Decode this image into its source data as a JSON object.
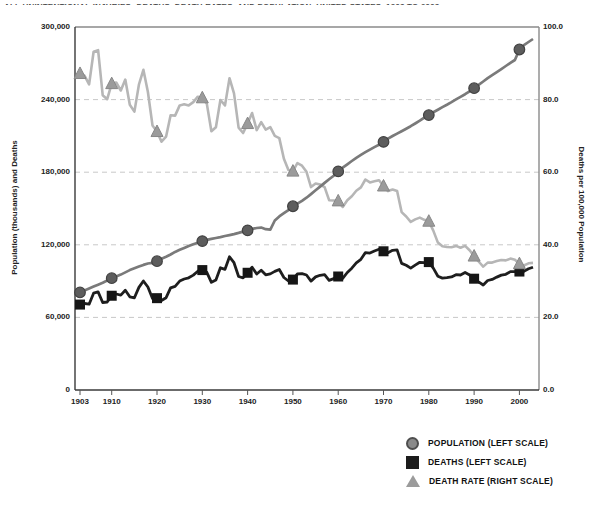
{
  "title": {
    "clipped_text": "ALL UNINTENTIONAL INJURIES: DEATHS, DEATH RATES, AND POPULATION, UNITED STATES, 1903 TO 2003"
  },
  "axes": {
    "left_label": "Population (thousands) and Deaths",
    "right_label": "Deaths per 100,000 Population",
    "left_ticks": [
      "300,000",
      "240,000",
      "180,000",
      "120,000",
      "60,000",
      "0"
    ],
    "right_ticks": [
      "100.0",
      "80.0",
      "60.0",
      "40.0",
      "20.0",
      "0.0"
    ],
    "x_ticks": [
      "1903",
      "1910",
      "1920",
      "1930",
      "1940",
      "1950",
      "1960",
      "1970",
      "1980",
      "1990",
      "2000"
    ]
  },
  "legend": {
    "items": [
      {
        "marker": "circle",
        "label": "POPULATION (LEFT SCALE)",
        "color": "#8a8a8a"
      },
      {
        "marker": "square",
        "label": "DEATHS (LEFT SCALE)",
        "color": "#1c1c1c"
      },
      {
        "marker": "triangle",
        "label": "DEATH RATE (RIGHT SCALE)",
        "color": "#9b9b9b"
      }
    ]
  },
  "colors": {
    "population_line": "#7a7a7a",
    "population_marker_fill": "#5d5d5d",
    "population_marker_stroke": "#424242",
    "deaths_line": "#1e1e1e",
    "deaths_marker_fill": "#161616",
    "rate_line": "#b6b6b6",
    "rate_marker_fill": "#9b9b9b",
    "rate_marker_stroke": "#878787",
    "gridline": "#c8c8c8",
    "frame_light": "#8a8a8a",
    "frame_dark": "#3a3a3a",
    "tick": "#555555"
  },
  "chart_data": {
    "type": "line",
    "title": "All unintentional injuries: deaths, death rates, and population, United States, 1903 to 2003",
    "xlabel": "",
    "ylabel_left": "Population (thousands) and Deaths",
    "ylabel_right": "Deaths per 100,000 Population",
    "left_ylim": [
      0,
      300000
    ],
    "right_ylim": [
      0,
      100
    ],
    "grid": "horizontal-dashed",
    "grid_values_right": [
      80,
      60,
      40,
      20
    ],
    "legend_position": "below-right",
    "marker_years": [
      1903,
      1910,
      1920,
      1930,
      1940,
      1950,
      1960,
      1970,
      1980,
      1990,
      2000
    ],
    "x": [
      1903,
      1904,
      1905,
      1906,
      1907,
      1908,
      1909,
      1910,
      1911,
      1912,
      1913,
      1914,
      1915,
      1916,
      1917,
      1918,
      1919,
      1920,
      1921,
      1922,
      1923,
      1924,
      1925,
      1926,
      1927,
      1928,
      1929,
      1930,
      1931,
      1932,
      1933,
      1934,
      1935,
      1936,
      1937,
      1938,
      1939,
      1940,
      1941,
      1942,
      1943,
      1944,
      1945,
      1946,
      1947,
      1948,
      1949,
      1950,
      1951,
      1952,
      1953,
      1954,
      1955,
      1956,
      1957,
      1958,
      1959,
      1960,
      1961,
      1962,
      1963,
      1964,
      1965,
      1966,
      1967,
      1968,
      1969,
      1970,
      1971,
      1972,
      1973,
      1974,
      1975,
      1976,
      1977,
      1978,
      1979,
      1980,
      1981,
      1982,
      1983,
      1984,
      1985,
      1986,
      1987,
      1988,
      1989,
      1990,
      1991,
      1992,
      1993,
      1994,
      1995,
      1996,
      1997,
      1998,
      1999,
      2000,
      2001,
      2002,
      2003
    ],
    "series": [
      {
        "name": "Population (thousands)",
        "axis": "left",
        "marker": "circle",
        "values": [
          80632,
          82165,
          83820,
          85437,
          87000,
          88709,
          90492,
          92407,
          93868,
          95331,
          97227,
          99118,
          100549,
          101966,
          103414,
          104550,
          105063,
          106461,
          108538,
          110049,
          111947,
          114109,
          115829,
          117397,
          119035,
          120509,
          121767,
          123077,
          124040,
          124840,
          125579,
          126374,
          127250,
          128053,
          128825,
          129825,
          130880,
          131954,
          133121,
          133920,
          134245,
          132885,
          132481,
          140054,
          143446,
          146093,
          148665,
          151868,
          153982,
          156393,
          158956,
          161884,
          165069,
          168088,
          171187,
          174149,
          177135,
          180671,
          183691,
          186538,
          189242,
          191889,
          194303,
          196560,
          198712,
          200706,
          202677,
          205052,
          207661,
          209896,
          211909,
          213854,
          215973,
          218035,
          220239,
          222585,
          225055,
          227225,
          229466,
          231664,
          233792,
          235825,
          237924,
          240133,
          242289,
          244499,
          246819,
          249438,
          252127,
          254995,
          257746,
          260289,
          262765,
          265190,
          267744,
          270299,
          272691,
          281422,
          284969,
          287625,
          290108
        ]
      },
      {
        "name": "Deaths",
        "axis": "left",
        "marker": "square",
        "values": [
          70600,
          71500,
          70900,
          80000,
          81070,
          72300,
          72700,
          77900,
          79300,
          78400,
          82500,
          77000,
          76200,
          84800,
          90100,
          85100,
          75500,
          75900,
          74000,
          76300,
          84400,
          85600,
          90000,
          91700,
          92700,
          95000,
          98200,
          99100,
          97300,
          89000,
          90932,
          100977,
          99773,
          110052,
          105205,
          93805,
          92623,
          96885,
          101513,
          95889,
          99038,
          95237,
          95918,
          98033,
          99579,
          93000,
          90106,
          91249,
          95871,
          96172,
          95032,
          90032,
          93443,
          94780,
          95307,
          90604,
          92080,
          93806,
          92249,
          97139,
          100669,
          105000,
          108004,
          113563,
          113169,
          114864,
          116385,
          114638,
          113439,
          115448,
          115821,
          104622,
          103030,
          100761,
          103202,
          105561,
          105312,
          105718,
          100704,
          94082,
          92488,
          92911,
          93457,
          95277,
          95020,
          97100,
          95028,
          91983,
          89347,
          86777,
          90523,
          91437,
          93320,
          94948,
          95644,
          97835,
          97860,
          97900,
          98000,
          100200,
          101500
        ]
      },
      {
        "name": "Death rate per 100,000 population",
        "axis": "right",
        "marker": "triangle",
        "values": [
          87.2,
          86.6,
          84.2,
          93.2,
          93.6,
          81.2,
          80.1,
          84.4,
          84.7,
          82.5,
          85.5,
          78.6,
          76.7,
          84.1,
          88.2,
          82.1,
          72.9,
          71.2,
          68.4,
          69.8,
          75.7,
          75.6,
          78.4,
          78.7,
          78.4,
          79.3,
          80.8,
          80.5,
          78.9,
          71.3,
          72.4,
          79.9,
          78.4,
          85.9,
          81.7,
          72.3,
          70.8,
          73.4,
          76.3,
          71.6,
          73.8,
          71.7,
          72.4,
          70.0,
          69.4,
          63.7,
          60.6,
          60.3,
          62.5,
          61.8,
          60.1,
          55.9,
          56.9,
          56.6,
          55.9,
          52.3,
          52.2,
          52.1,
          50.4,
          52.3,
          53.4,
          54.9,
          55.8,
          58.0,
          57.2,
          57.5,
          57.8,
          56.2,
          54.8,
          55.2,
          54.8,
          49.0,
          47.8,
          46.3,
          47.0,
          47.5,
          46.9,
          46.5,
          43.9,
          40.6,
          39.6,
          39.4,
          39.3,
          39.7,
          39.2,
          39.7,
          38.5,
          36.9,
          35.4,
          34.0,
          35.1,
          35.1,
          35.5,
          35.8,
          35.7,
          36.2,
          35.9,
          34.8,
          34.3,
          34.9,
          35.0
        ]
      }
    ]
  }
}
